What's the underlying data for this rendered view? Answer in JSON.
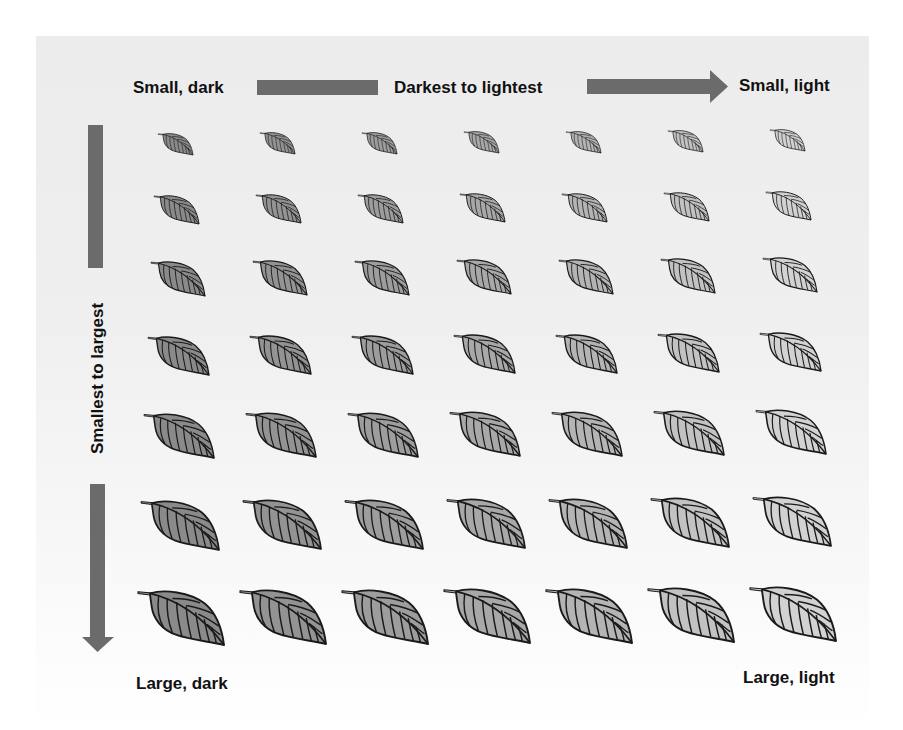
{
  "diagram": {
    "top_axis": {
      "left_label": "Small, dark",
      "center_label": "Darkest to lightest",
      "right_label": "Small, light"
    },
    "left_axis": {
      "label": "Smallest to largest"
    },
    "bottom_labels": {
      "left": "Large, dark",
      "right": "Large, light"
    },
    "colors": {
      "arrow": "#6b6b6b",
      "leaf_outline": "#1a1a1a",
      "background_top": "#ececec",
      "background_bottom": "#ffffff"
    },
    "grid": {
      "rows": 7,
      "columns": 7,
      "row_description": "leaf size increases from top (smallest) to bottom (largest)",
      "column_description": "leaf shade goes from darkest (left) to lightest (right)",
      "column_fills": [
        "#8a8a8a",
        "#939393",
        "#9d9d9d",
        "#a8a8a8",
        "#b4b4b4",
        "#c2c2c2",
        "#d2d2d2"
      ],
      "row_sizes": [
        35,
        45,
        54,
        61,
        70,
        78,
        86
      ]
    }
  }
}
